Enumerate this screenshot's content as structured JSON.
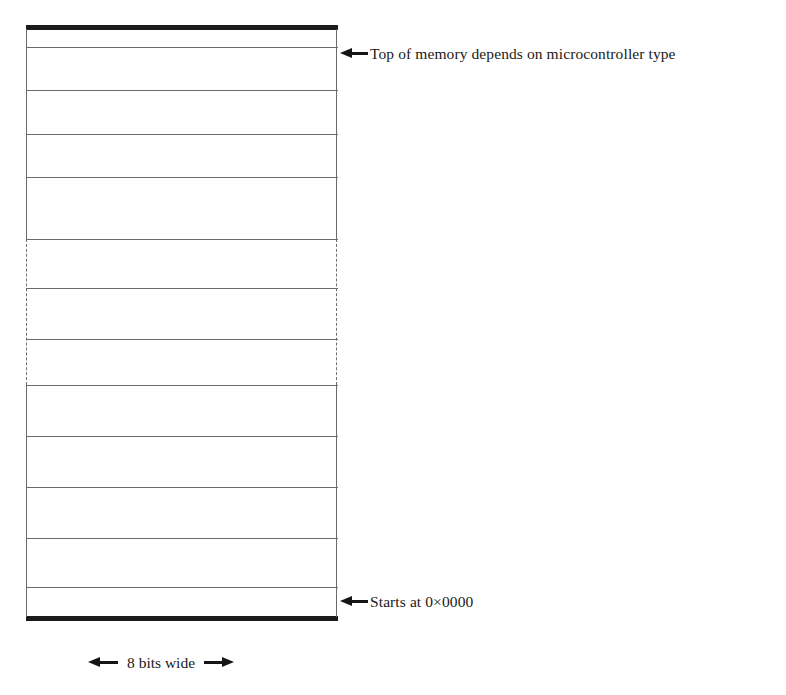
{
  "figure": {
    "kind": "memory-map-diagram",
    "line_color": "#6a6a6a",
    "cap_color": "#1b1b1b",
    "background": "#ffffff"
  },
  "annotations": {
    "top": {
      "arrow": "arrow-left-icon",
      "text": "Top of memory depends on microcontroller type"
    },
    "bottom": {
      "arrow": "arrow-left-icon",
      "text": "Starts at 0×0000"
    }
  },
  "width_dimension": {
    "left_arrow": "arrow-left-icon",
    "right_arrow": "arrow-right-icon",
    "text": "8 bits wide"
  },
  "memory_block": {
    "top_cap": "thick-bar",
    "bottom_cap": "thick-bar",
    "dividers_y": [
      47,
      90,
      134,
      177,
      216,
      258,
      302,
      358,
      410,
      462,
      513,
      562
    ],
    "dashed_region": {
      "start_y": 214,
      "end_y": 360
    }
  }
}
